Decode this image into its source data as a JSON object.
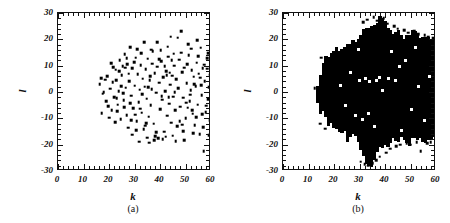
{
  "figure": {
    "background_color": "#ffffff",
    "marker_color": "#000000",
    "axis_color": "#111111",
    "panel_count": 2
  },
  "chart_data": [
    {
      "type": "scatter",
      "panel_label": "(a)",
      "title": "",
      "xlabel": "k",
      "ylabel": "l",
      "xlim": [
        0,
        60
      ],
      "ylim": [
        -30,
        30
      ],
      "xticks": [
        0,
        10,
        20,
        30,
        40,
        50,
        60
      ],
      "yticks": [
        -30,
        -20,
        -10,
        0,
        10,
        20,
        30
      ],
      "xticklabels": [
        "0",
        "10",
        "20",
        "30",
        "40",
        "50",
        "60"
      ],
      "yticklabels": [
        "-30",
        "-20",
        "-10",
        "0",
        "10",
        "20",
        "30"
      ],
      "minor_ticks": true,
      "grid": false,
      "legend": null,
      "marker": "square",
      "marker_size_px": 2.6,
      "n_points": 186,
      "points": [
        [
          16.4,
          3.0
        ],
        [
          17.0,
          5.2
        ],
        [
          17.6,
          -0.6
        ],
        [
          18.4,
          4.6
        ],
        [
          19.2,
          6.0
        ],
        [
          19.6,
          -5.4
        ],
        [
          20.4,
          1.2
        ],
        [
          21.0,
          -6.8
        ],
        [
          21.6,
          9.4
        ],
        [
          22.0,
          -2.0
        ],
        [
          22.6,
          8.4
        ],
        [
          23.2,
          -7.4
        ],
        [
          23.8,
          0.4
        ],
        [
          24.2,
          12.0
        ],
        [
          24.6,
          -10.4
        ],
        [
          25.0,
          6.4
        ],
        [
          25.4,
          9.8
        ],
        [
          25.8,
          -3.2
        ],
        [
          26.2,
          14.4
        ],
        [
          26.6,
          1.6
        ],
        [
          26.9,
          -8.8
        ],
        [
          27.2,
          10.6
        ],
        [
          27.6,
          -13.6
        ],
        [
          28.0,
          4.0
        ],
        [
          28.4,
          17.0
        ],
        [
          28.8,
          -1.4
        ],
        [
          29.2,
          9.0
        ],
        [
          29.6,
          -6.2
        ],
        [
          30.0,
          2.4
        ],
        [
          30.4,
          13.0
        ],
        [
          30.8,
          -11.0
        ],
        [
          31.2,
          6.8
        ],
        [
          31.6,
          -3.8
        ],
        [
          32.0,
          0.8
        ],
        [
          32.4,
          10.2
        ],
        [
          32.8,
          -7.8
        ],
        [
          33.2,
          5.0
        ],
        [
          33.6,
          -14.2
        ],
        [
          34.0,
          2.0
        ],
        [
          34.4,
          8.6
        ],
        [
          34.8,
          -2.6
        ],
        [
          35.2,
          12.6
        ],
        [
          35.6,
          -9.4
        ],
        [
          36.0,
          4.4
        ],
        [
          36.4,
          -5.0
        ],
        [
          36.8,
          1.0
        ],
        [
          37.2,
          15.4
        ],
        [
          37.6,
          -12.0
        ],
        [
          38.0,
          7.2
        ],
        [
          38.4,
          -0.2
        ],
        [
          38.8,
          9.6
        ],
        [
          39.2,
          -17.6
        ],
        [
          39.6,
          3.6
        ],
        [
          40.0,
          -6.6
        ],
        [
          40.4,
          11.8
        ],
        [
          40.8,
          -3.0
        ],
        [
          41.2,
          5.6
        ],
        [
          41.6,
          -15.0
        ],
        [
          42.0,
          0.2
        ],
        [
          42.4,
          8.0
        ],
        [
          42.8,
          -9.0
        ],
        [
          43.2,
          13.4
        ],
        [
          43.6,
          -4.4
        ],
        [
          44.0,
          2.8
        ],
        [
          44.4,
          -11.6
        ],
        [
          44.8,
          6.2
        ],
        [
          45.2,
          -1.8
        ],
        [
          45.6,
          10.0
        ],
        [
          46.0,
          -7.0
        ],
        [
          46.4,
          4.8
        ],
        [
          46.8,
          -13.0
        ],
        [
          47.2,
          1.4
        ],
        [
          47.6,
          12.2
        ],
        [
          48.0,
          -5.6
        ],
        [
          48.4,
          23.2
        ],
        [
          48.8,
          7.6
        ],
        [
          49.2,
          -2.2
        ],
        [
          49.6,
          9.2
        ],
        [
          50.0,
          -10.0
        ],
        [
          50.4,
          3.4
        ],
        [
          50.8,
          -6.0
        ],
        [
          51.2,
          14.0
        ],
        [
          51.6,
          -3.4
        ],
        [
          52.0,
          0.6
        ],
        [
          52.4,
          8.2
        ],
        [
          52.8,
          -8.2
        ],
        [
          53.2,
          5.8
        ],
        [
          53.6,
          -12.6
        ],
        [
          54.0,
          2.2
        ],
        [
          54.4,
          11.2
        ],
        [
          54.8,
          -4.8
        ],
        [
          55.2,
          7.0
        ],
        [
          55.6,
          -16.0
        ],
        [
          56.0,
          16.8
        ],
        [
          56.4,
          -1.2
        ],
        [
          56.8,
          9.0
        ],
        [
          57.2,
          -22.4
        ],
        [
          57.6,
          4.2
        ],
        [
          58.0,
          -7.6
        ],
        [
          58.4,
          12.8
        ],
        [
          58.8,
          -2.8
        ],
        [
          59.2,
          1.8
        ],
        [
          59.6,
          -10.8
        ],
        [
          59.8,
          6.6
        ],
        [
          20.0,
          -9.8
        ],
        [
          22.4,
          -11.4
        ],
        [
          24.0,
          7.8
        ],
        [
          26.0,
          -5.8
        ],
        [
          27.8,
          7.0
        ],
        [
          29.0,
          -16.2
        ],
        [
          31.0,
          16.2
        ],
        [
          33.0,
          -0.8
        ],
        [
          35.0,
          -17.4
        ],
        [
          37.0,
          10.8
        ],
        [
          39.0,
          19.0
        ],
        [
          41.0,
          -18.0
        ],
        [
          43.0,
          17.2
        ],
        [
          45.0,
          -16.6
        ],
        [
          47.0,
          20.6
        ],
        [
          49.0,
          -14.8
        ],
        [
          51.0,
          18.2
        ],
        [
          53.0,
          -15.6
        ],
        [
          55.0,
          13.6
        ],
        [
          57.0,
          -13.4
        ],
        [
          59.0,
          14.8
        ],
        [
          18.0,
          0.0
        ],
        [
          21.4,
          3.8
        ],
        [
          23.0,
          -2.4
        ],
        [
          25.6,
          -0.4
        ],
        [
          28.2,
          -4.2
        ],
        [
          30.2,
          -8.6
        ],
        [
          32.2,
          -6.4
        ],
        [
          34.2,
          -12.8
        ],
        [
          36.2,
          6.0
        ],
        [
          38.2,
          -16.8
        ],
        [
          40.2,
          15.8
        ],
        [
          42.2,
          -17.0
        ],
        [
          44.2,
          21.0
        ],
        [
          46.2,
          -18.6
        ],
        [
          48.2,
          15.0
        ],
        [
          50.2,
          -4.0
        ],
        [
          52.2,
          16.4
        ],
        [
          54.2,
          -9.6
        ],
        [
          56.2,
          2.6
        ],
        [
          58.2,
          -5.2
        ],
        [
          19.0,
          -3.6
        ],
        [
          24.8,
          2.2
        ],
        [
          29.8,
          11.4
        ],
        [
          33.8,
          18.8
        ],
        [
          35.8,
          -19.2
        ],
        [
          37.8,
          -18.4
        ],
        [
          39.8,
          12.4
        ],
        [
          43.8,
          7.4
        ],
        [
          45.8,
          0.0
        ],
        [
          47.8,
          -11.2
        ],
        [
          51.8,
          -1.0
        ],
        [
          55.8,
          5.4
        ],
        [
          59.4,
          -16.4
        ],
        [
          17.2,
          -8.0
        ],
        [
          20.8,
          11.0
        ],
        [
          22.8,
          4.4
        ],
        [
          26.4,
          9.2
        ],
        [
          30.6,
          -14.6
        ],
        [
          34.6,
          -11.8
        ],
        [
          36.6,
          16.0
        ],
        [
          38.6,
          -15.2
        ],
        [
          40.6,
          -1.6
        ],
        [
          42.6,
          6.4
        ],
        [
          44.6,
          12.0
        ],
        [
          48.6,
          -12.4
        ],
        [
          50.6,
          10.6
        ],
        [
          52.6,
          -6.8
        ],
        [
          54.6,
          19.6
        ],
        [
          56.6,
          -8.4
        ],
        [
          58.6,
          8.8
        ],
        [
          27.0,
          12.8
        ],
        [
          31.8,
          -18.8
        ],
        [
          35.4,
          1.8
        ],
        [
          41.8,
          9.8
        ],
        [
          45.4,
          14.6
        ],
        [
          49.4,
          -18.2
        ],
        [
          53.4,
          3.0
        ],
        [
          57.4,
          10.4
        ],
        [
          23.4,
          -4.8
        ],
        [
          28.6,
          -10.6
        ],
        [
          32.6,
          14.8
        ],
        [
          43.4,
          -2.0
        ]
      ]
    },
    {
      "type": "scatter",
      "panel_label": "(b)",
      "title": "",
      "xlabel": "k",
      "ylabel": "l",
      "xlim": [
        0,
        60
      ],
      "ylim": [
        -30,
        30
      ],
      "xticks": [
        0,
        10,
        20,
        30,
        40,
        50,
        60
      ],
      "yticks": [
        -30,
        -20,
        -10,
        0,
        10,
        20,
        30
      ],
      "xticklabels": [
        "0",
        "10",
        "20",
        "30",
        "40",
        "50",
        "60"
      ],
      "yticklabels": [
        "-30",
        "-20",
        "-10",
        "0",
        "10",
        "20",
        "30"
      ],
      "minor_ticks": true,
      "grid": false,
      "legend": null,
      "marker": "square",
      "marker_size_px": 2.6,
      "density": "saturated",
      "description": "Dense saturated cloud of points filling k from about 13 to 60 and l from about -28 to +29, with a ragged wedge-shaped boundary that widens with increasing k; isolated outlier points appear beyond the main blob.",
      "blob_profile": [
        {
          "k": 13,
          "l_min": -3,
          "l_max": 3
        },
        {
          "k": 14,
          "l_min": -6,
          "l_max": 6
        },
        {
          "k": 15,
          "l_min": -8,
          "l_max": 9
        },
        {
          "k": 16,
          "l_min": -10,
          "l_max": 11
        },
        {
          "k": 17,
          "l_min": -11,
          "l_max": 12
        },
        {
          "k": 18,
          "l_min": -12,
          "l_max": 13
        },
        {
          "k": 19,
          "l_min": -13,
          "l_max": 14
        },
        {
          "k": 20,
          "l_min": -14,
          "l_max": 14
        },
        {
          "k": 21,
          "l_min": -14,
          "l_max": 15
        },
        {
          "k": 22,
          "l_min": -15,
          "l_max": 15
        },
        {
          "k": 23,
          "l_min": -15,
          "l_max": 16
        },
        {
          "k": 24,
          "l_min": -16,
          "l_max": 16
        },
        {
          "k": 25,
          "l_min": -16,
          "l_max": 17
        },
        {
          "k": 26,
          "l_min": -17,
          "l_max": 17
        },
        {
          "k": 27,
          "l_min": -17,
          "l_max": 18
        },
        {
          "k": 28,
          "l_min": -18,
          "l_max": 19
        },
        {
          "k": 29,
          "l_min": -19,
          "l_max": 20
        },
        {
          "k": 30,
          "l_min": -23,
          "l_max": 21
        },
        {
          "k": 31,
          "l_min": -25,
          "l_max": 22
        },
        {
          "k": 32,
          "l_min": -25,
          "l_max": 23
        },
        {
          "k": 33,
          "l_min": -26,
          "l_max": 24
        },
        {
          "k": 34,
          "l_min": -26,
          "l_max": 25
        },
        {
          "k": 35,
          "l_min": -25,
          "l_max": 25
        },
        {
          "k": 36,
          "l_min": -24,
          "l_max": 26
        },
        {
          "k": 37,
          "l_min": -22,
          "l_max": 26
        },
        {
          "k": 38,
          "l_min": -21,
          "l_max": 26
        },
        {
          "k": 39,
          "l_min": -20,
          "l_max": 25
        },
        {
          "k": 40,
          "l_min": -19,
          "l_max": 25
        },
        {
          "k": 41,
          "l_min": -19,
          "l_max": 24
        },
        {
          "k": 42,
          "l_min": -18,
          "l_max": 23
        },
        {
          "k": 43,
          "l_min": -18,
          "l_max": 22
        },
        {
          "k": 44,
          "l_min": -18,
          "l_max": 22
        },
        {
          "k": 45,
          "l_min": -18,
          "l_max": 21
        },
        {
          "k": 46,
          "l_min": -18,
          "l_max": 21
        },
        {
          "k": 47,
          "l_min": -18,
          "l_max": 21
        },
        {
          "k": 48,
          "l_min": -18,
          "l_max": 21
        },
        {
          "k": 49,
          "l_min": -18,
          "l_max": 21
        },
        {
          "k": 50,
          "l_min": -18,
          "l_max": 21
        },
        {
          "k": 51,
          "l_min": -18,
          "l_max": 21
        },
        {
          "k": 52,
          "l_min": -18,
          "l_max": 20
        },
        {
          "k": 53,
          "l_min": -18,
          "l_max": 20
        },
        {
          "k": 54,
          "l_min": -18,
          "l_max": 20
        },
        {
          "k": 55,
          "l_min": -18,
          "l_max": 20
        },
        {
          "k": 56,
          "l_min": -18,
          "l_max": 20
        },
        {
          "k": 57,
          "l_min": -18,
          "l_max": 20
        },
        {
          "k": 58,
          "l_min": -18,
          "l_max": 19
        },
        {
          "k": 59,
          "l_min": -18,
          "l_max": 19
        },
        {
          "k": 60,
          "l_min": -18,
          "l_max": 19
        }
      ],
      "outliers": [
        [
          31.5,
          26.5
        ],
        [
          33.0,
          27.5
        ],
        [
          35.5,
          28.5
        ],
        [
          37.0,
          27.0
        ],
        [
          39.5,
          28.0
        ],
        [
          41.0,
          26.0
        ],
        [
          43.5,
          25.0
        ],
        [
          45.0,
          24.0
        ],
        [
          47.5,
          23.5
        ],
        [
          49.0,
          22.5
        ],
        [
          51.5,
          23.0
        ],
        [
          53.0,
          22.0
        ],
        [
          55.5,
          21.5
        ],
        [
          57.0,
          21.0
        ],
        [
          59.0,
          20.5
        ],
        [
          30.5,
          -26.5
        ],
        [
          32.0,
          -27.5
        ],
        [
          33.5,
          -28.0
        ],
        [
          35.0,
          -27.0
        ],
        [
          36.5,
          -26.0
        ],
        [
          38.0,
          -24.5
        ],
        [
          40.5,
          -23.0
        ],
        [
          42.0,
          -21.5
        ],
        [
          44.5,
          -20.5
        ],
        [
          46.0,
          -20.0
        ],
        [
          48.5,
          -19.5
        ],
        [
          50.0,
          -20.0
        ],
        [
          52.5,
          -19.0
        ],
        [
          54.0,
          -22.5
        ],
        [
          56.5,
          -19.5
        ],
        [
          58.0,
          -19.0
        ],
        [
          14.5,
          -12.0
        ],
        [
          15.0,
          13.0
        ],
        [
          16.5,
          -14.0
        ],
        [
          12.5,
          1.5
        ]
      ],
      "holes": [
        [
          30.0,
          4.5
        ],
        [
          32.5,
          5.0
        ],
        [
          34.0,
          4.0
        ],
        [
          36.5,
          4.5
        ],
        [
          38.0,
          5.5
        ],
        [
          41.5,
          5.0
        ],
        [
          44.0,
          4.5
        ],
        [
          28.5,
          -9.0
        ],
        [
          31.0,
          -10.5
        ],
        [
          33.5,
          -8.0
        ],
        [
          45.5,
          9.5
        ],
        [
          48.0,
          12.0
        ],
        [
          50.5,
          -6.5
        ],
        [
          53.0,
          2.0
        ],
        [
          55.5,
          -11.0
        ],
        [
          42.5,
          15.5
        ],
        [
          26.5,
          7.5
        ],
        [
          24.5,
          -5.0
        ],
        [
          57.5,
          6.0
        ],
        [
          36.0,
          -13.0
        ],
        [
          52.0,
          17.0
        ],
        [
          46.5,
          -14.5
        ],
        [
          29.5,
          16.0
        ],
        [
          39.0,
          0.5
        ],
        [
          22.5,
          2.5
        ]
      ]
    }
  ]
}
